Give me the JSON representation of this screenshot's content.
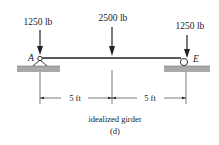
{
  "diagram": {
    "type": "idealized girder free-body diagram",
    "loads": [
      {
        "label": "1250 lb",
        "position": "A"
      },
      {
        "label": "2500 lb",
        "position": "midspan"
      },
      {
        "label": "1250 lb",
        "position": "E"
      }
    ],
    "supports": [
      {
        "label": "A",
        "type": "pin"
      },
      {
        "label": "E",
        "type": "roller"
      }
    ],
    "dimensions": [
      {
        "label": "5 ft"
      },
      {
        "label": "5 ft"
      }
    ],
    "caption": "idealized girder",
    "subcaption": "(d)"
  },
  "colors": {
    "line": "#222222",
    "ground": "#a9a9a9"
  }
}
